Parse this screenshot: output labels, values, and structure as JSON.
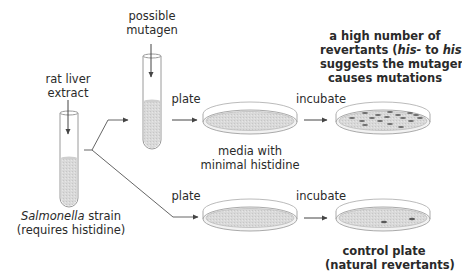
{
  "diagram": {
    "labels": {
      "rat_liver_line1": "rat liver",
      "rat_liver_line2": "extract",
      "possible_line1": "possible",
      "possible_line2": "mutagen",
      "strain_italic": "Salmonella",
      "strain_rest": " strain",
      "strain_line2": "(requires histidine)",
      "plate_top": "plate",
      "plate_bottom": "plate",
      "incubate_top": "incubate",
      "incubate_bottom": "incubate",
      "media_line1": "media with",
      "media_line2": "minimal histidine",
      "result_line1": "a high number of",
      "result_line2_a": "revertants (",
      "result_line2_his_minus": "his-",
      "result_line2_b": " to ",
      "result_line2_his_plus": "his+",
      "result_line2_c": ")",
      "result_line3": "suggests the mutagen",
      "result_line4": "causes mutations",
      "control_line1": "control plate",
      "control_line2": "(natural revertants)"
    },
    "nodes": [
      {
        "id": "tube-strain",
        "type": "test-tube",
        "contents": "Salmonella strain + rat liver extract"
      },
      {
        "id": "tube-mutagen",
        "type": "test-tube",
        "contents": "possible mutagen"
      },
      {
        "id": "dish-media-top",
        "type": "petri-dish",
        "colonies": 0
      },
      {
        "id": "dish-result-top",
        "type": "petri-dish",
        "colonies": 17
      },
      {
        "id": "dish-media-bottom",
        "type": "petri-dish",
        "colonies": 0
      },
      {
        "id": "dish-control",
        "type": "petri-dish",
        "colonies": 2
      }
    ],
    "colors": {
      "line": "#555555",
      "fill": "#d6d6d6",
      "glass": "#9a9a9a",
      "colony": "#6a6a6a"
    }
  }
}
